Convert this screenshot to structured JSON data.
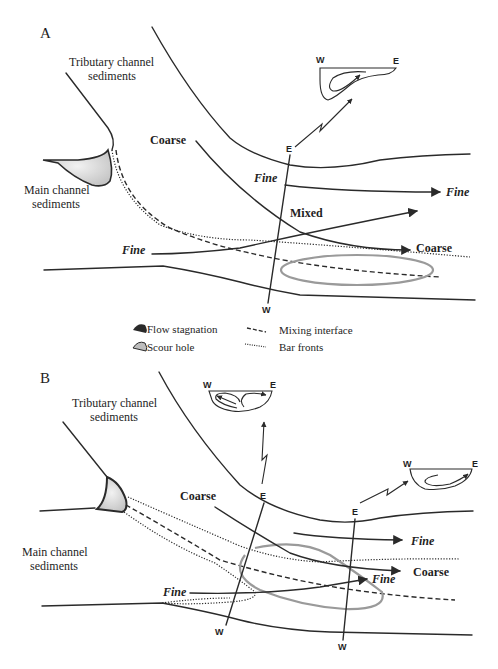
{
  "figure": {
    "panels": [
      {
        "id": "A",
        "letter": "A",
        "labels": {
          "tributary": [
            "Tributary channel",
            "sediments"
          ],
          "main": [
            "Main channel",
            "sediments"
          ],
          "coarse_in": "Coarse",
          "fine_in_top": "Fine",
          "fine_in_bottom": "Fine",
          "mixed": "Mixed",
          "fine_out": "Fine",
          "coarse_out": "Coarse"
        },
        "transect": {
          "top": "E",
          "bottom": "W"
        },
        "cross_sections": [
          {
            "west": "W",
            "east": "E",
            "cells": 1
          }
        ]
      },
      {
        "id": "B",
        "letter": "B",
        "labels": {
          "tributary": [
            "Tributary channel",
            "sediments"
          ],
          "main": [
            "Main channel",
            "sediments"
          ],
          "coarse_in": "Coarse",
          "fine_in_bottom": "Fine",
          "fine_out_top": "Fine",
          "fine_out_mid": "Fine",
          "coarse_out": "Coarse"
        },
        "transects": [
          {
            "top": "E",
            "bottom": "W"
          },
          {
            "top": "E",
            "bottom": "W"
          }
        ],
        "cross_sections": [
          {
            "west": "W",
            "east": "E",
            "cells": 2
          },
          {
            "west": "W",
            "east": "E",
            "cells": 1
          }
        ]
      }
    ],
    "legend": [
      {
        "symbol": "flow-stagnation",
        "label": "Flow stagnation"
      },
      {
        "symbol": "scour-hole",
        "label": "Scour hole"
      },
      {
        "symbol": "mixing-interface",
        "label": "Mixing interface"
      },
      {
        "symbol": "bar-fronts",
        "label": "Bar fronts"
      }
    ],
    "colors": {
      "line": "#2a2a2a",
      "stagnation_fill": "#d8d8d8",
      "scour_outline": "#9a9a9a",
      "background": "#ffffff"
    }
  }
}
